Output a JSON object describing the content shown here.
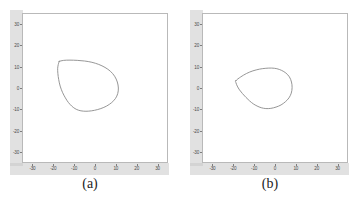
{
  "figure": {
    "background": "#ffffff",
    "axis_band_color": "#c9c9c9",
    "frame_color": "#b9b9b9",
    "curve_color": "#8a8a8a"
  },
  "panels": [
    {
      "id": "a",
      "caption": "(a)",
      "chart_data": {
        "type": "line",
        "title": "",
        "xlabel": "",
        "ylabel": "",
        "xlim": [
          -35,
          35
        ],
        "ylim": [
          -35,
          35
        ],
        "xticks": [
          "-30",
          "-20",
          "-10",
          "0",
          "10",
          "20",
          "30"
        ],
        "xtick_values": [
          -30,
          -20,
          -10,
          0,
          10,
          20,
          30
        ],
        "yticks": [
          "30",
          "20",
          "10",
          "0",
          "-10",
          "-20",
          "-30"
        ],
        "ytick_values": [
          30,
          20,
          10,
          0,
          -10,
          -20,
          -30
        ],
        "grid": false,
        "legend": "none",
        "series": [
          {
            "name": "closed-contour-a",
            "closed": true,
            "x": [
              -17.2,
              -15.0,
              -12.0,
              -8.5,
              -5.0,
              -1.5,
              1.8,
              4.8,
              7.4,
              9.4,
              10.7,
              11.2,
              10.9,
              9.8,
              8.0,
              5.6,
              2.8,
              -0.2,
              -3.0,
              -5.6,
              -7.8,
              -9.6,
              -11.2,
              -12.8,
              -14.2,
              -15.6,
              -16.7,
              -17.4,
              -17.8,
              -17.9,
              -17.6,
              -17.3
            ],
            "y": [
              12.4,
              12.9,
              13.0,
              12.9,
              12.6,
              12.0,
              11.0,
              9.6,
              7.8,
              5.5,
              2.8,
              0.0,
              -2.6,
              -4.9,
              -6.8,
              -8.4,
              -9.6,
              -10.4,
              -10.8,
              -10.8,
              -10.4,
              -9.6,
              -8.4,
              -6.7,
              -4.6,
              -2.0,
              0.9,
              3.9,
              6.8,
              9.2,
              11.0,
              12.0
            ]
          }
        ]
      }
    },
    {
      "id": "b",
      "caption": "(b)",
      "chart_data": {
        "type": "line",
        "title": "",
        "xlabel": "",
        "ylabel": "",
        "xlim": [
          -35,
          35
        ],
        "ylim": [
          -35,
          35
        ],
        "xticks": [
          "-30",
          "-20",
          "-10",
          "0",
          "10",
          "20",
          "30"
        ],
        "xtick_values": [
          -30,
          -20,
          -10,
          0,
          10,
          20,
          30
        ],
        "yticks": [
          "30",
          "20",
          "10",
          "0",
          "-10",
          "-20",
          "-30"
        ],
        "ytick_values": [
          30,
          20,
          10,
          0,
          -10,
          -20,
          -30
        ],
        "grid": false,
        "legend": "none",
        "series": [
          {
            "name": "closed-contour-b",
            "closed": true,
            "x": [
              -18.8,
              -16.4,
              -13.6,
              -10.6,
              -7.4,
              -4.4,
              -1.6,
              0.9,
              3.2,
              5.2,
              6.9,
              7.9,
              8.2,
              7.8,
              6.7,
              5.0,
              2.9,
              0.5,
              -2.0,
              -4.4,
              -6.6,
              -8.6,
              -10.4,
              -12.2,
              -13.9,
              -15.6,
              -17.0,
              -18.1,
              -18.7
            ],
            "y": [
              3.4,
              5.2,
              6.8,
              8.0,
              8.8,
              9.2,
              9.3,
              9.0,
              8.2,
              7.0,
              5.2,
              2.8,
              0.2,
              -2.4,
              -4.6,
              -6.4,
              -7.9,
              -8.9,
              -9.5,
              -9.6,
              -9.2,
              -8.4,
              -7.4,
              -6.0,
              -4.4,
              -2.6,
              -0.9,
              0.9,
              2.4
            ]
          }
        ]
      }
    }
  ]
}
